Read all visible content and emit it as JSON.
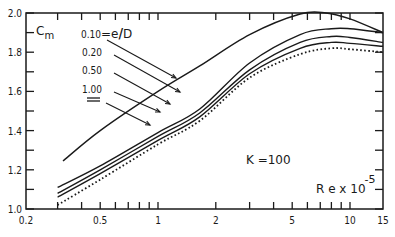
{
  "chart_data": {
    "type": "line",
    "title": "",
    "xlabel": "Re x 10^-5",
    "ylabel": "Cm",
    "xscale": "log",
    "xlim": [
      0.2,
      15
    ],
    "ylim": [
      1.0,
      2.0
    ],
    "x_ticks": [
      0.2,
      0.5,
      1,
      2,
      5,
      10,
      15
    ],
    "x_tick_labels": [
      "0.2",
      "0.5",
      "1",
      "2",
      "5",
      "10",
      "15"
    ],
    "x_minor_ticks": [
      0.3,
      0.4,
      0.6,
      0.7,
      0.8,
      0.9,
      3,
      4,
      6,
      7,
      8,
      9
    ],
    "y_ticks": [
      1.0,
      1.2,
      1.4,
      1.6,
      1.8,
      2.0
    ],
    "y_tick_labels": [
      "1.0",
      "1.2",
      "1.4",
      "1.6",
      "1.8",
      "2.0"
    ],
    "y_minor_ticks": [
      1.1,
      1.3,
      1.5,
      1.7,
      1.9
    ],
    "grid": false,
    "legend_position": "upper-left (annotated with arrows)",
    "legend_title": "e/D",
    "annotations": [
      "K = 100",
      "Re x 10^-5",
      "Cm",
      "0.10 = e/D"
    ],
    "series": [
      {
        "name": "0.10",
        "style": "solid",
        "x": [
          0.32,
          0.5,
          1.0,
          1.65,
          3.0,
          5.5,
          7.5,
          10,
          15
        ],
        "y": [
          1.245,
          1.4,
          1.6,
          1.73,
          1.89,
          1.995,
          2.0,
          1.97,
          1.9
        ]
      },
      {
        "name": "0.20",
        "style": "solid",
        "x": [
          0.3,
          0.5,
          1.0,
          1.65,
          3.0,
          5.5,
          8,
          10,
          15
        ],
        "y": [
          1.11,
          1.22,
          1.39,
          1.51,
          1.745,
          1.89,
          1.92,
          1.92,
          1.9
        ]
      },
      {
        "name": "0.50",
        "style": "solid",
        "x": [
          0.3,
          0.5,
          1.0,
          1.65,
          3.0,
          5.5,
          8,
          10,
          15
        ],
        "y": [
          1.08,
          1.2,
          1.37,
          1.49,
          1.71,
          1.85,
          1.88,
          1.875,
          1.85
        ]
      },
      {
        "name": "1.00",
        "style": "solid",
        "x": [
          0.3,
          0.5,
          1.0,
          1.65,
          3.0,
          5.5,
          8,
          10,
          15
        ],
        "y": [
          1.06,
          1.18,
          1.35,
          1.47,
          1.69,
          1.82,
          1.85,
          1.845,
          1.83
        ]
      },
      {
        "name": "∞",
        "style": "dotted",
        "x": [
          0.3,
          0.5,
          1.0,
          1.65,
          3.0,
          5.5,
          8,
          10,
          15
        ],
        "y": [
          1.02,
          1.15,
          1.33,
          1.45,
          1.67,
          1.79,
          1.82,
          1.815,
          1.8
        ]
      }
    ]
  },
  "labels": {
    "ylabel_main": "C",
    "ylabel_sub": "m",
    "legend_first": "0.10",
    "legend_eq": "=e",
    "legend_slash": "/",
    "legend_D": "D",
    "legend_items": [
      "0.20",
      "0.50",
      "1.00"
    ],
    "k_label": "K =100",
    "x_label_main": "R e x 10",
    "x_label_exp": "-5"
  }
}
